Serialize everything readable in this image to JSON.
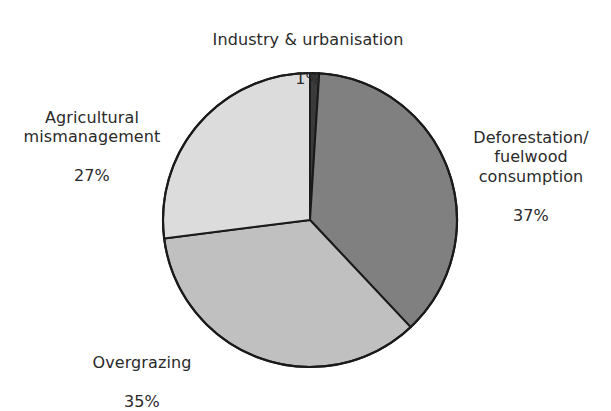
{
  "chart_data": {
    "type": "pie",
    "title": "",
    "subtitle": "",
    "xlabel": "",
    "ylabel": "",
    "legend_position": "none",
    "grid": false,
    "unit": "%",
    "categories": [
      "Industry & urbanisation",
      "Deforestation/ fuelwood consumption",
      "Overgrazing",
      "Agricultural mismanagement"
    ],
    "values": [
      1,
      37,
      35,
      27
    ],
    "slices": [
      {
        "label": "Industry & urbanisation",
        "label_lines": "Industry & urbanisation",
        "value": 1,
        "value_text": "1%",
        "color": "#3a3a3a",
        "start_angle_deg": 0,
        "end_angle_deg": 3.6
      },
      {
        "label": "Deforestation/ fuelwood consumption",
        "label_lines": "Deforestation/\nfuelwood\nconsumption",
        "value": 37,
        "value_text": "37%",
        "color": "#808080",
        "start_angle_deg": 3.6,
        "end_angle_deg": 136.8
      },
      {
        "label": "Overgrazing",
        "label_lines": "Overgrazing",
        "value": 35,
        "value_text": "35%",
        "color": "#c0c0c0",
        "start_angle_deg": 136.8,
        "end_angle_deg": 262.8
      },
      {
        "label": "Agricultural mismanagement",
        "label_lines": "Agricultural\nmismanagement",
        "value": 27,
        "value_text": "27%",
        "color": "#dcdcdc",
        "start_angle_deg": 262.8,
        "end_angle_deg": 360
      }
    ],
    "stroke_color": "#1a1a1a",
    "background_color": "#ffffff"
  },
  "labels": {
    "industry": {
      "name": "Industry & urbanisation",
      "value": "1%"
    },
    "deforestation": {
      "name": "Deforestation/\nfuelwood\nconsumption",
      "value": "37%"
    },
    "agricultural": {
      "name": "Agricultural\nmismanagement",
      "value": "27%"
    },
    "overgrazing": {
      "name": "Overgrazing",
      "value": "35%"
    }
  }
}
